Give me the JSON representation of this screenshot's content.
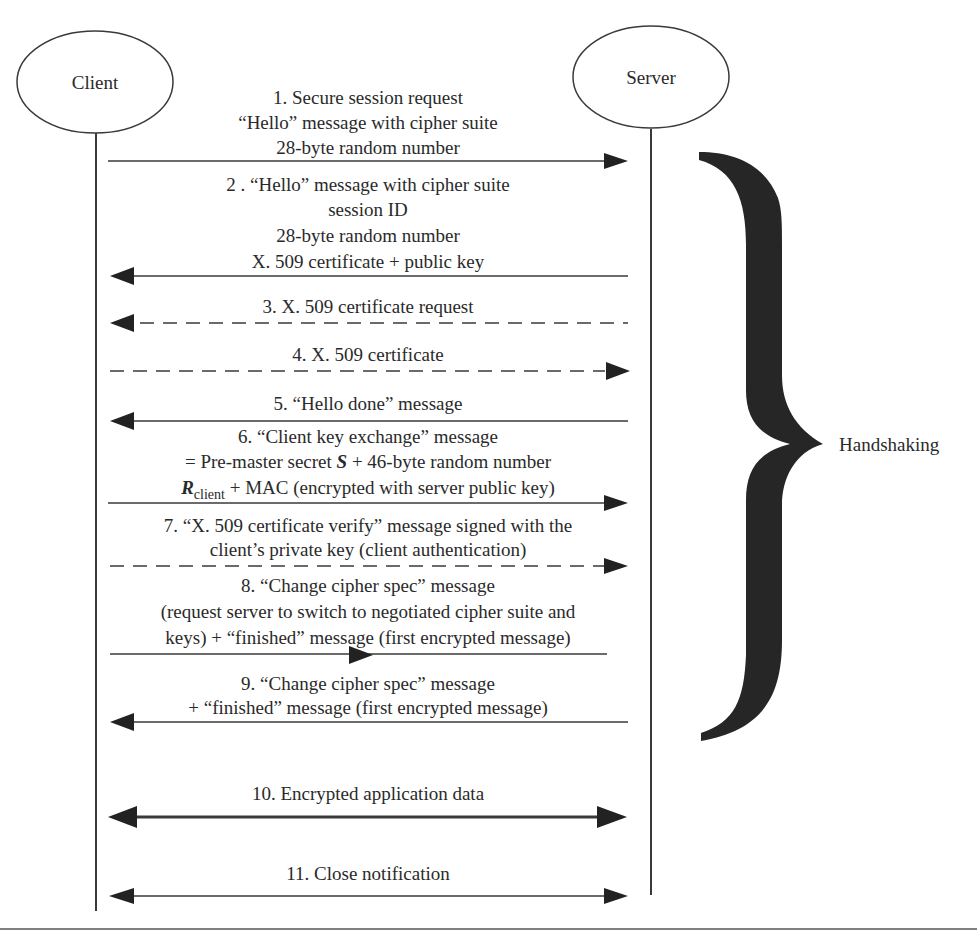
{
  "diagram": {
    "type": "sequence",
    "colors": {
      "line": "#3a3a3a",
      "arrowhead": "#222222",
      "brace": "#262626",
      "text": "#2a2a2a",
      "background": "#ffffff"
    },
    "participants": {
      "client": {
        "label": "Client"
      },
      "server": {
        "label": "Server"
      }
    },
    "brace_label": "Handshaking",
    "messages": [
      {
        "id": 1,
        "direction": "client-to-server",
        "style": "solid",
        "lines": [
          "1. Secure session request",
          "“Hello” message with cipher suite",
          "28-byte random number"
        ]
      },
      {
        "id": 2,
        "direction": "server-to-client",
        "style": "solid",
        "lines": [
          "2 . “Hello” message with cipher suite",
          "session ID",
          "28-byte random number",
          "X. 509 certificate + public key"
        ]
      },
      {
        "id": 3,
        "direction": "server-to-client",
        "style": "dashed",
        "lines": [
          "3. X. 509 certificate request"
        ]
      },
      {
        "id": 4,
        "direction": "client-to-server",
        "style": "dashed",
        "lines": [
          "4. X. 509 certificate"
        ]
      },
      {
        "id": 5,
        "direction": "server-to-client",
        "style": "solid",
        "lines": [
          "5. “Hello done” message"
        ]
      },
      {
        "id": 6,
        "direction": "client-to-server",
        "style": "solid",
        "lines": [
          "6. “Client key exchange” message"
        ],
        "line2": {
          "prefix": "= Pre-master secret ",
          "var": "S",
          "suffix": " + 46-byte random number"
        },
        "line3": {
          "var": "R",
          "sub": "client",
          "suffix": " + MAC (encrypted with server public key)"
        }
      },
      {
        "id": 7,
        "direction": "client-to-server",
        "style": "dashed",
        "lines": [
          "7. “X. 509 certificate verify” message signed with the",
          "client’s private key (client authentication)"
        ]
      },
      {
        "id": 8,
        "direction": "client-to-server",
        "style": "solid",
        "lines": [
          "8. “Change cipher spec” message",
          "(request server to switch to negotiated cipher suite and",
          "keys) + “finished” message (first encrypted message)"
        ]
      },
      {
        "id": 9,
        "direction": "server-to-client",
        "style": "solid",
        "lines": [
          "9. “Change cipher spec” message",
          "+ “finished” message (first encrypted message)"
        ]
      },
      {
        "id": 10,
        "direction": "bidirectional",
        "style": "solid-thick",
        "lines": [
          "10. Encrypted application data"
        ]
      },
      {
        "id": 11,
        "direction": "bidirectional",
        "style": "solid",
        "lines": [
          "11. Close notification"
        ]
      }
    ]
  }
}
